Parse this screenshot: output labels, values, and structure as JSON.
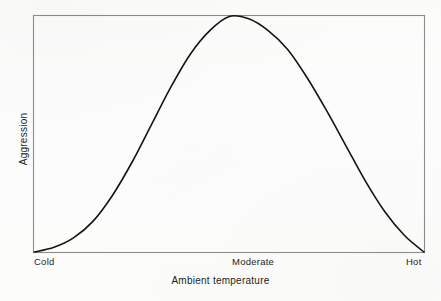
{
  "chart_data": {
    "type": "line",
    "title": "",
    "subtitle": "",
    "xlabel": "Ambient temperature",
    "ylabel": "Aggression",
    "xtick_labels": [
      "Cold",
      "Moderate",
      "Hot"
    ],
    "xtick_positions": [
      0,
      0.5,
      1
    ],
    "ytick_labels": [],
    "grid": false,
    "legend": null,
    "annotations": [],
    "xlim": [
      0,
      1
    ],
    "ylim": [
      0,
      1
    ],
    "frame": "full-box",
    "line_color": "#141414",
    "line_width": 1.6,
    "series": [
      {
        "name": "Aggression",
        "shape": "inverted-U bell curve",
        "x": [
          0.0,
          0.05,
          0.1,
          0.15,
          0.2,
          0.25,
          0.3,
          0.35,
          0.4,
          0.45,
          0.5,
          0.55,
          0.6,
          0.65,
          0.7,
          0.75,
          0.8,
          0.85,
          0.9,
          0.95,
          1.0
        ],
        "y": [
          0.0,
          0.02,
          0.06,
          0.13,
          0.24,
          0.38,
          0.54,
          0.7,
          0.84,
          0.94,
          1.0,
          0.99,
          0.94,
          0.86,
          0.74,
          0.6,
          0.45,
          0.3,
          0.17,
          0.07,
          0.0
        ],
        "peak_x": 0.5,
        "peak_label": "Moderate"
      }
    ]
  },
  "axis": {
    "x_ticks": {
      "cold": "Cold",
      "moderate": "Moderate",
      "hot": "Hot"
    },
    "x_title": "Ambient temperature",
    "y_title": "Aggression"
  },
  "colors": {
    "background": "#fdfdfc",
    "frame": "#8d8d8d",
    "curve": "#141414",
    "text": "#1d1d1d"
  }
}
